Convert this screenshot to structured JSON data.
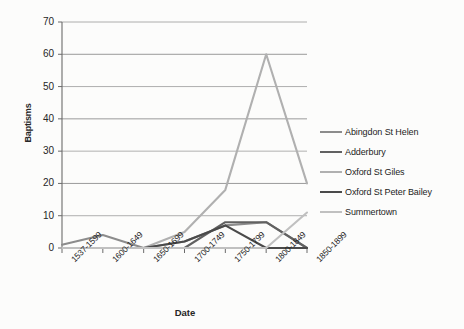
{
  "chart_data": {
    "type": "line",
    "title": "",
    "xlabel": "Date",
    "ylabel": "Baptisms",
    "categories": [
      "1537-1599",
      "1600-1649",
      "1650-1699",
      "1700-1749",
      "1750-1799",
      "1800-1849",
      "1850-1899"
    ],
    "ylim": [
      0,
      70
    ],
    "ytick_values": [
      0,
      10,
      20,
      30,
      40,
      50,
      60,
      70
    ],
    "ytick_labels": [
      "0",
      "10",
      "20",
      "30",
      "40",
      "50",
      "60",
      "70"
    ],
    "grid": "horizontal",
    "legend_position": "right",
    "series": [
      {
        "name": "Abingdon St Helen",
        "color": "#8c8c8c",
        "values": [
          1,
          4,
          0,
          2,
          7,
          8,
          0
        ]
      },
      {
        "name": "Adderbury",
        "color": "#616161",
        "values": [
          0,
          0,
          0,
          0,
          8,
          8,
          0
        ]
      },
      {
        "name": "Oxford St Giles",
        "color": "#b0b0b0",
        "values": [
          0,
          0,
          0,
          5,
          18,
          60,
          20
        ]
      },
      {
        "name": "Oxford St Peter Bailey",
        "color": "#4a4a4a",
        "values": [
          0,
          0,
          0,
          2,
          7,
          0,
          0
        ]
      },
      {
        "name": "Summertown",
        "color": "#c0c0c0",
        "values": [
          0,
          0,
          0,
          0,
          0,
          0,
          11
        ]
      }
    ]
  },
  "axes": {
    "y_title": "Baptisms",
    "x_title": "Date"
  },
  "colors": {
    "axis": "#6b6b6b",
    "grid": "#9a9a9a",
    "background": "#fcfcfb",
    "text": "#262626"
  }
}
